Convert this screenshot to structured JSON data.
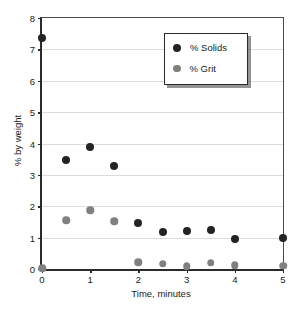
{
  "chart_data": {
    "type": "scatter",
    "title": "",
    "xlabel": "Time, minutes",
    "ylabel": "% by weight",
    "xlim": [
      0,
      5
    ],
    "ylim": [
      0,
      8
    ],
    "xticks": [
      0,
      1,
      2,
      3,
      4,
      5
    ],
    "yticks": [
      0,
      1,
      2,
      3,
      4,
      5,
      6,
      7,
      8
    ],
    "xticklabels": [
      "0",
      "1",
      "2",
      "3",
      "4",
      "5"
    ],
    "yticklabels": [
      "0",
      "1",
      "2",
      "3",
      "4",
      "5",
      "6",
      "7",
      "8"
    ],
    "grid": "horizontal",
    "legend_position": "upper-right-inside",
    "series": [
      {
        "name": "% Solids",
        "color": "#232323",
        "x": [
          0,
          0.5,
          1,
          1.5,
          2,
          2.5,
          3,
          3.5,
          4,
          5
        ],
        "values": [
          7.35,
          3.48,
          3.9,
          3.28,
          1.48,
          1.18,
          1.2,
          1.24,
          0.95,
          0.98
        ]
      },
      {
        "name": "% Grit",
        "color": "#808080",
        "x": [
          0,
          0.5,
          1,
          1.5,
          2,
          2.5,
          3,
          3.5,
          4,
          5
        ],
        "values": [
          0.02,
          1.55,
          1.88,
          1.52,
          0.22,
          0.16,
          0.08,
          0.2,
          0.12,
          0.1
        ]
      }
    ]
  },
  "legend": {
    "entries": [
      {
        "label": "% Solids"
      },
      {
        "label": "% Grit"
      }
    ]
  }
}
